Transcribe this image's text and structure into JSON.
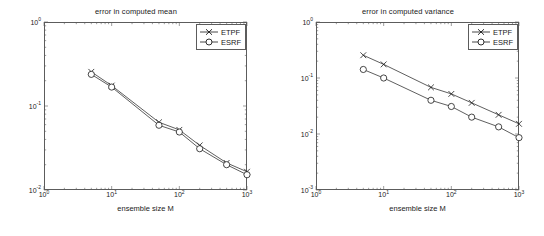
{
  "figure": {
    "panels": [
      {
        "id": "mean",
        "title": "error in computed mean",
        "xlabel": "ensemble size M",
        "ylabel": "",
        "xticks": [
          "10",
          "10",
          "10",
          "10"
        ],
        "xtick_exps": [
          "0",
          "1",
          "2",
          "3"
        ],
        "yticks": [
          "10",
          "10",
          "10"
        ],
        "ytick_exps": [
          "0",
          "-1",
          "-2"
        ],
        "legend": [
          {
            "label": "ETPF",
            "marker": "x"
          },
          {
            "label": "ESRF",
            "marker": "o"
          }
        ]
      },
      {
        "id": "variance",
        "title": "error in computed variance",
        "xlabel": "ensemble size M",
        "ylabel": "",
        "xticks": [
          "10",
          "10",
          "10",
          "10"
        ],
        "xtick_exps": [
          "0",
          "1",
          "2",
          "3"
        ],
        "yticks": [
          "10",
          "10",
          "10",
          "10"
        ],
        "ytick_exps": [
          "0",
          "-1",
          "-2",
          "-3"
        ],
        "legend": [
          {
            "label": "ETPF",
            "marker": "x"
          },
          {
            "label": "ESRF",
            "marker": "o"
          }
        ]
      }
    ]
  },
  "chart_data": [
    {
      "type": "line",
      "title": "error in computed mean",
      "xlabel": "ensemble size M",
      "ylabel": "",
      "xscale": "log",
      "yscale": "log",
      "xlim": [
        1,
        1000
      ],
      "ylim": [
        0.01,
        1
      ],
      "grid": false,
      "legend_position": "top-right",
      "x": [
        5,
        10,
        50,
        100,
        200,
        500,
        1000
      ],
      "series": [
        {
          "name": "ETPF",
          "marker": "x",
          "color": "#1a1a1a",
          "values": [
            0.255,
            0.175,
            0.064,
            0.052,
            0.034,
            0.021,
            0.0165
          ]
        },
        {
          "name": "ESRF",
          "marker": "o",
          "color": "#1a1a1a",
          "values": [
            0.238,
            0.168,
            0.059,
            0.049,
            0.031,
            0.02,
            0.0152
          ]
        }
      ]
    },
    {
      "type": "line",
      "title": "error in computed variance",
      "xlabel": "ensemble size M",
      "ylabel": "",
      "xscale": "log",
      "yscale": "log",
      "xlim": [
        1,
        1000
      ],
      "ylim": [
        0.001,
        1
      ],
      "grid": false,
      "legend_position": "top-right",
      "x": [
        5,
        10,
        50,
        100,
        200,
        500,
        1000
      ],
      "series": [
        {
          "name": "ETPF",
          "marker": "x",
          "color": "#1a1a1a",
          "values": [
            0.255,
            0.175,
            0.068,
            0.052,
            0.036,
            0.022,
            0.0152
          ]
        },
        {
          "name": "ESRF",
          "marker": "o",
          "color": "#1a1a1a",
          "values": [
            0.142,
            0.1,
            0.04,
            0.031,
            0.02,
            0.0134,
            0.0086
          ]
        }
      ]
    }
  ]
}
